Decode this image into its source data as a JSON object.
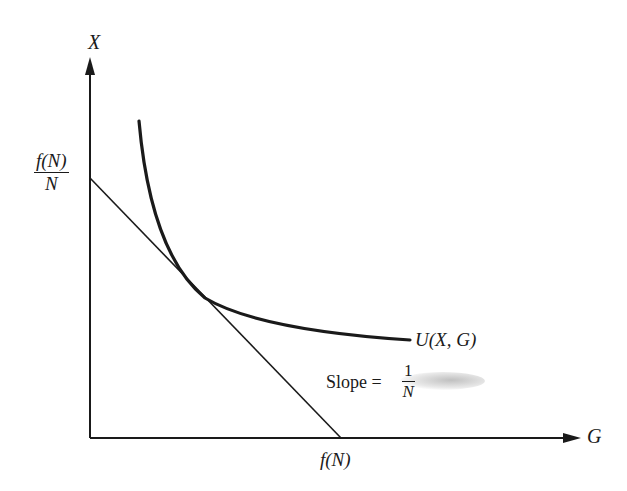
{
  "diagram": {
    "type": "indifference-curve-budget-line",
    "axes": {
      "y_label": "X",
      "x_label": "G"
    },
    "y_intercept_label": {
      "numerator": "f(N)",
      "denominator": "N"
    },
    "x_intercept_label": "f(N)",
    "curve_label": "U(X, G)",
    "slope_label": {
      "prefix": "Slope =",
      "numerator": "1",
      "denominator": "N"
    },
    "colors": {
      "ink": "#1a1a1a",
      "background": "#ffffff"
    }
  }
}
